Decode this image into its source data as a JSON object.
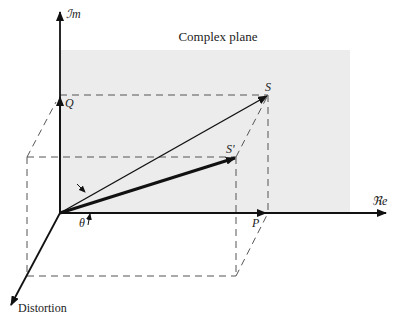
{
  "diagram": {
    "title": "Complex plane",
    "axes": {
      "imaginary": "ℐm",
      "real": "ℜe",
      "distortion": "Distortion"
    },
    "points": {
      "S": "S",
      "S_prime": "S'",
      "Q": "Q",
      "P": "P"
    },
    "angle": "θ",
    "colors": {
      "plane_fill": "#ececec",
      "line": "#1a1a1a",
      "dash": "#555555"
    }
  }
}
